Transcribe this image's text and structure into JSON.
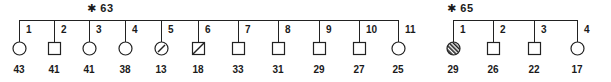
{
  "diagram": {
    "type": "pedigree",
    "families": [
      {
        "label": "⁎ 63",
        "star_glyph": "*",
        "id": "63",
        "line": {
          "x1": 19,
          "x2": 398,
          "y": 20
        },
        "title_pos": {
          "x": 87,
          "y": 2
        },
        "members": [
          {
            "n": "1",
            "sex": "female",
            "status": "unaffected",
            "age": "43",
            "x": 19
          },
          {
            "n": "2",
            "sex": "male",
            "status": "unaffected",
            "age": "41",
            "x": 54
          },
          {
            "n": "3",
            "sex": "female",
            "status": "unaffected",
            "age": "41",
            "x": 89
          },
          {
            "n": "4",
            "sex": "female",
            "status": "unaffected",
            "age": "38",
            "x": 125
          },
          {
            "n": "5",
            "sex": "female",
            "status": "slashed",
            "age": "13",
            "x": 161
          },
          {
            "n": "6",
            "sex": "male",
            "status": "slashed",
            "age": "18",
            "x": 198
          },
          {
            "n": "7",
            "sex": "male",
            "status": "unaffected",
            "age": "33",
            "x": 238
          },
          {
            "n": "8",
            "sex": "male",
            "status": "unaffected",
            "age": "31",
            "x": 278
          },
          {
            "n": "9",
            "sex": "male",
            "status": "unaffected",
            "age": "29",
            "x": 319
          },
          {
            "n": "10",
            "sex": "male",
            "status": "unaffected",
            "age": "27",
            "x": 359
          },
          {
            "n": "11",
            "sex": "female",
            "status": "unaffected",
            "age": "25",
            "x": 398
          }
        ]
      },
      {
        "label": "⁎ 65",
        "star_glyph": "*",
        "id": "65",
        "line": {
          "x1": 453,
          "x2": 577,
          "y": 20
        },
        "title_pos": {
          "x": 447,
          "y": 2
        },
        "members": [
          {
            "n": "1",
            "sex": "female",
            "status": "hatched",
            "age": "29",
            "x": 453
          },
          {
            "n": "2",
            "sex": "male",
            "status": "unaffected",
            "age": "26",
            "x": 493
          },
          {
            "n": "3",
            "sex": "male",
            "status": "unaffected",
            "age": "22",
            "x": 534
          },
          {
            "n": "4",
            "sex": "female",
            "status": "unaffected",
            "age": "17",
            "x": 577
          }
        ]
      }
    ],
    "colors": {
      "ink": "#222222",
      "background": "#ffffff"
    }
  }
}
